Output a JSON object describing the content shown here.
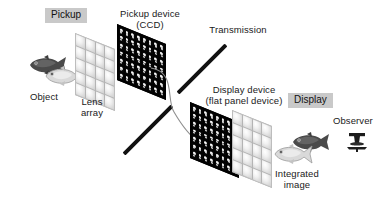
{
  "diagram": {
    "labels": {
      "pickup_tag": "Pickup",
      "display_tag": "Display",
      "pickup_device": "Pickup device\n(CCD)",
      "transmission": "Transmission",
      "display_device": "Display device\n(flat panel device)",
      "object": "Object",
      "lens_array_left": "Lens\narray",
      "integrated_image": "Integrated\nimage",
      "observer": "Observer"
    },
    "colors": {
      "tag_background": "#c9c9c9",
      "text": "#1a1a1a",
      "panel_dark": "#000000",
      "lens_light": "#d8d8d8",
      "bar": "#111111",
      "curve": "#8a8a8a",
      "fish_dark": "#3b3b3b",
      "fish_light": "#d2d2d2"
    },
    "grids": {
      "lens_array_left": {
        "cols": 4,
        "rows": 5
      },
      "pickup_device": {
        "cols": 8,
        "rows": 7
      },
      "display_device": {
        "cols": 8,
        "rows": 7
      },
      "lens_array_right": {
        "cols": 4,
        "rows": 5
      }
    },
    "objects": {
      "scene_fish_count": 2,
      "integrated_fish_count": 2
    }
  }
}
